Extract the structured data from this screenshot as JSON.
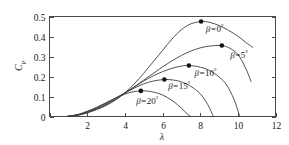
{
  "chart_data": {
    "type": "line",
    "title": "",
    "xlabel": "λ",
    "ylabel": "C_p",
    "ylabel_main": "C",
    "ylabel_sub": "p",
    "xlim": [
      0,
      12
    ],
    "ylim": [
      0,
      0.5
    ],
    "grid": false,
    "legend_position": "inline-annotations",
    "xticks": [
      0,
      2,
      4,
      6,
      8,
      10,
      12
    ],
    "xtick_labels": [
      "",
      "2",
      "4",
      "6",
      "8",
      "10",
      "12"
    ],
    "yticks": [
      0,
      0.1,
      0.2,
      0.3,
      0.4,
      0.5
    ],
    "ytick_labels": [
      "0",
      "0.1",
      "0.2",
      "0.3",
      "0.4",
      "0.5"
    ],
    "series": [
      {
        "name": "β=0°",
        "label_prefix": "β=",
        "label_value": "0",
        "label_unit": "°",
        "peak": {
          "lambda": 8.05,
          "cp": 0.475
        },
        "x": [
          0.9,
          1.5,
          2.0,
          2.5,
          3.0,
          3.5,
          4.0,
          4.5,
          5.0,
          5.5,
          6.0,
          6.5,
          7.0,
          7.5,
          8.05,
          8.5,
          9.0,
          9.5,
          10.0,
          10.4,
          10.8
        ],
        "y": [
          0.0,
          0.006,
          0.018,
          0.034,
          0.055,
          0.082,
          0.118,
          0.163,
          0.216,
          0.273,
          0.33,
          0.387,
          0.434,
          0.463,
          0.475,
          0.471,
          0.455,
          0.431,
          0.402,
          0.372,
          0.345
        ]
      },
      {
        "name": "β=5°",
        "label_prefix": "β=",
        "label_value": "5",
        "label_unit": "°",
        "peak": {
          "lambda": 9.15,
          "cp": 0.355
        },
        "x": [
          0.9,
          1.5,
          2.0,
          2.5,
          3.0,
          3.5,
          4.0,
          4.5,
          5.0,
          5.5,
          6.0,
          6.5,
          7.0,
          7.5,
          8.0,
          8.5,
          9.15,
          9.6,
          10.0,
          10.4,
          10.7
        ],
        "y": [
          0.0,
          0.007,
          0.02,
          0.037,
          0.058,
          0.085,
          0.115,
          0.148,
          0.182,
          0.215,
          0.248,
          0.278,
          0.305,
          0.327,
          0.343,
          0.352,
          0.355,
          0.34,
          0.31,
          0.245,
          0.175
        ]
      },
      {
        "name": "β=10°",
        "label_prefix": "β=",
        "label_value": "10",
        "label_unit": "°",
        "peak": {
          "lambda": 7.4,
          "cp": 0.255
        },
        "x": [
          0.9,
          1.5,
          2.0,
          2.5,
          3.0,
          3.5,
          4.0,
          4.5,
          5.0,
          5.5,
          6.0,
          6.5,
          7.0,
          7.4,
          8.0,
          8.5,
          9.0,
          9.4,
          9.8,
          10.1
        ],
        "y": [
          0.0,
          0.008,
          0.022,
          0.04,
          0.062,
          0.089,
          0.118,
          0.148,
          0.177,
          0.203,
          0.224,
          0.241,
          0.252,
          0.255,
          0.247,
          0.23,
          0.198,
          0.158,
          0.085,
          0.0
        ]
      },
      {
        "name": "β=15°",
        "label_prefix": "β=",
        "label_value": "15",
        "label_unit": "°",
        "peak": {
          "lambda": 6.1,
          "cp": 0.185
        },
        "x": [
          0.9,
          1.5,
          2.0,
          2.5,
          3.0,
          3.5,
          4.0,
          4.5,
          5.0,
          5.5,
          6.1,
          6.6,
          7.0,
          7.5,
          8.0,
          8.4,
          8.7
        ],
        "y": [
          0.0,
          0.009,
          0.024,
          0.043,
          0.066,
          0.092,
          0.118,
          0.142,
          0.163,
          0.177,
          0.185,
          0.182,
          0.173,
          0.151,
          0.114,
          0.06,
          0.0
        ]
      },
      {
        "name": "β=20°",
        "label_prefix": "β=",
        "label_value": "20",
        "label_unit": "°",
        "peak": {
          "lambda": 4.85,
          "cp": 0.128
        },
        "x": [
          0.9,
          1.5,
          2.0,
          2.5,
          3.0,
          3.5,
          4.0,
          4.4,
          4.85,
          5.3,
          5.8,
          6.2,
          6.6,
          7.0,
          7.3,
          7.5
        ],
        "y": [
          0.0,
          0.01,
          0.026,
          0.046,
          0.069,
          0.092,
          0.112,
          0.123,
          0.128,
          0.126,
          0.115,
          0.098,
          0.074,
          0.042,
          0.014,
          0.0
        ]
      }
    ],
    "annotations": [
      {
        "text": "β=0°",
        "lambda": 8.3,
        "cp": 0.425
      },
      {
        "text": "β=5°",
        "lambda": 9.6,
        "cp": 0.292
      },
      {
        "text": "β=10°",
        "lambda": 7.7,
        "cp": 0.205
      },
      {
        "text": "β=15°",
        "lambda": 6.3,
        "cp": 0.138
      },
      {
        "text": "β=20°",
        "lambda": 4.6,
        "cp": 0.062
      }
    ]
  },
  "axes": {
    "x_title": "λ",
    "y_title_main": "C",
    "y_title_sub": "p"
  },
  "colors": {
    "curve": "#3d3d3d",
    "axis": "#4a4a4a",
    "marker": "#111111",
    "background": "#ffffff",
    "text": "#1a1a1a"
  }
}
